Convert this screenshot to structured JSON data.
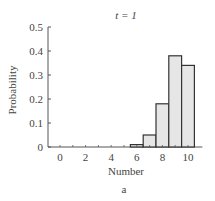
{
  "chart_data": {
    "type": "bar",
    "title": "t = 1",
    "xlabel": "Number",
    "ylabel": "Probability",
    "caption": "a",
    "categories": [
      0,
      1,
      2,
      3,
      4,
      5,
      6,
      7,
      8,
      9,
      10
    ],
    "values": [
      0.0,
      0.0,
      0.0,
      0.0,
      0.0,
      0.0,
      0.01,
      0.05,
      0.18,
      0.38,
      0.34
    ],
    "xticks": [
      "0",
      "2",
      "4",
      "6",
      "8",
      "10"
    ],
    "yticks": [
      "0",
      "0.1",
      "0.2",
      "0.3",
      "0.4",
      "0.5"
    ],
    "ylim": [
      0,
      0.5
    ],
    "grid": false,
    "bar_fill": "#e6e6e6",
    "bar_edge": "#333333"
  }
}
